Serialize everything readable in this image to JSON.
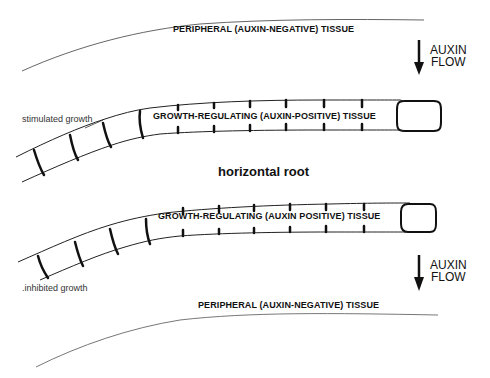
{
  "diagram": {
    "title": "horizontal root",
    "top": {
      "peripheral_label": "PERIPHERAL (AUXIN-NEGATIVE) TISSUE",
      "growth_regulating_label": "GROWTH-REGULATING (AUXIN-POSITIVE) TISSUE",
      "growth_note": "stimulated growth",
      "flow_label_line1": "AUXIN",
      "flow_label_line2": "FLOW"
    },
    "bottom": {
      "peripheral_label": "PERIPHERAL (AUXIN-NEGATIVE) TISSUE",
      "growth_regulating_label": "GROWTH-REGULATING (AUXIN POSITIVE) TISSUE",
      "growth_note": ".inhibited growth",
      "flow_label_line1": "AUXIN",
      "flow_label_line2": "FLOW"
    },
    "colors": {
      "line": "#111111",
      "thin_line": "#555555",
      "background": "#ffffff"
    }
  }
}
